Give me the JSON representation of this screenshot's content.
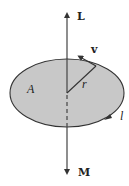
{
  "diagram": {
    "labels": {
      "angular_momentum": "L",
      "magnetic_moment": "M",
      "velocity": "v",
      "radius": "r",
      "area": "A",
      "current": "l"
    },
    "colors": {
      "disk_fill": "#c8c8c8",
      "stroke": "#333333",
      "background": "#ffffff"
    }
  }
}
